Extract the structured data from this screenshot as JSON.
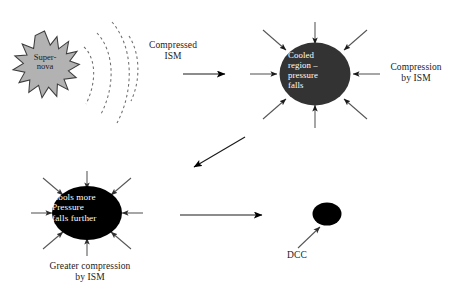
{
  "diagram": {
    "background_color": "#ffffff",
    "nodes": {
      "supernova": {
        "shape": "star-burst",
        "label": "Super-\nnova",
        "fill_color": "#b0b0b0",
        "stroke_color": "#3d3d3d",
        "text_color": "#1c1c1c"
      },
      "cooled_region": {
        "shape": "ellipse",
        "label": "Cooled\nregion –\npressure\nfalls",
        "fill_color": "#333333",
        "text_color": "#ffffff"
      },
      "cools_more": {
        "shape": "ellipse",
        "label": "Cools more\nPressure\nfalls further",
        "fill_color": "#000000",
        "text_color": "#ffffff"
      },
      "dcc": {
        "shape": "ellipse",
        "label": "DCC",
        "fill_color": "#000000",
        "text_color": "#1a1a1a"
      }
    },
    "labels": {
      "compressed_ism": "Compressed\nISM",
      "compression_by_ism": "Compression\nby ISM",
      "greater_compression_by_ism": "Greater compression\nby ISM",
      "dcc": "DCC"
    },
    "waves": {
      "name": "shock-wave-arcs",
      "count": 3,
      "style": "dashed",
      "stroke_color": "#6b6b6b"
    },
    "arrows": {
      "flow": [
        {
          "name": "supernova-to-cooled-region",
          "direction": "right",
          "style": "solid"
        },
        {
          "name": "cooled-region-to-cools-more",
          "direction": "down-left",
          "style": "solid"
        },
        {
          "name": "cools-more-to-dcc",
          "direction": "right",
          "style": "solid"
        },
        {
          "name": "dcc-pointer",
          "direction": "up-right",
          "style": "solid"
        }
      ],
      "inward_cooled_region": 8,
      "inward_cools_more": 8,
      "stroke_color": "#555555"
    }
  }
}
